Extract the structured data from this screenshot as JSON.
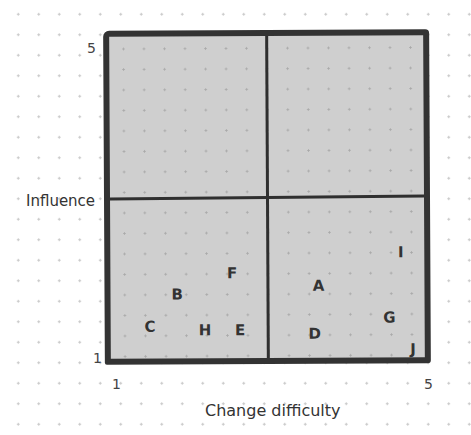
{
  "chart_data": {
    "type": "scatter",
    "title": "",
    "xlabel": "Change difficulty",
    "ylabel": "Influence",
    "xlim": [
      1,
      5
    ],
    "ylim": [
      1,
      5
    ],
    "x_ticks": [
      "1",
      "5"
    ],
    "y_ticks": [
      "1",
      "5"
    ],
    "quadrant_divider": {
      "x": 3,
      "y": 3
    },
    "grid": false,
    "points": [
      {
        "label": "A",
        "x": 3.65,
        "y": 1.9
      },
      {
        "label": "B",
        "x": 1.85,
        "y": 1.8
      },
      {
        "label": "C",
        "x": 1.5,
        "y": 1.4
      },
      {
        "label": "D",
        "x": 3.6,
        "y": 1.3
      },
      {
        "label": "E",
        "x": 2.65,
        "y": 1.35
      },
      {
        "label": "F",
        "x": 2.55,
        "y": 2.05
      },
      {
        "label": "G",
        "x": 4.55,
        "y": 1.5
      },
      {
        "label": "H",
        "x": 2.2,
        "y": 1.35
      },
      {
        "label": "I",
        "x": 4.7,
        "y": 2.3
      },
      {
        "label": "J",
        "x": 4.85,
        "y": 1.1
      }
    ],
    "colors": {
      "plot_fill": "#cfcfcf",
      "border": "#333333",
      "text": "#333333"
    }
  },
  "axis": {
    "x_min_label": "1",
    "x_max_label": "5",
    "y_min_label": "1",
    "y_max_label": "5",
    "x_title": "Change difficulty",
    "y_title": "Influence"
  }
}
